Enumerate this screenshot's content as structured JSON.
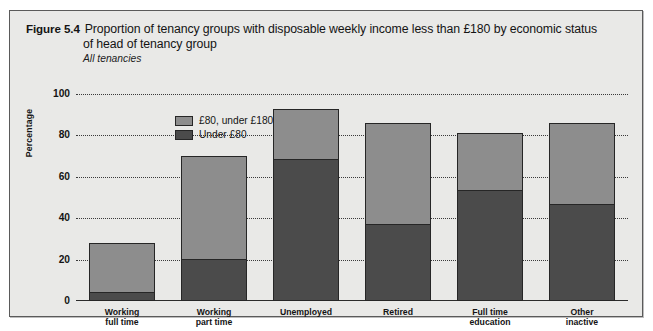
{
  "figure": {
    "number": "Figure 5.4",
    "title_line1": "Proportion of tenancy groups with disposable weekly income less than £180 by economic status",
    "title_line2": "of head of tenancy group",
    "subtitle": "All tenancies"
  },
  "legend": {
    "items": [
      {
        "label": "£80, under £180",
        "color": "#8d8d8d"
      },
      {
        "label": "Under £80",
        "color": "#4b4b4b"
      }
    ]
  },
  "axes": {
    "ylabel": "Percentage",
    "yticks": [
      "100",
      "80",
      "60",
      "40",
      "20",
      "0"
    ]
  },
  "chart_data": {
    "type": "bar",
    "stacked": true,
    "title": "Proportion of tenancy groups with disposable weekly income less than £180 by economic status of head of tenancy group",
    "subtitle": "All tenancies",
    "xlabel": "",
    "ylabel": "Percentage",
    "ylim": [
      0,
      100
    ],
    "ytick_step": 20,
    "grid": "horizontal-dotted",
    "legend_position": "top-left-inside",
    "categories": [
      "Working full time",
      "Working part time",
      "Unemployed",
      "Retired",
      "Full time education",
      "Other inactive"
    ],
    "category_lines": [
      [
        "Working",
        "full time"
      ],
      [
        "Working",
        "part time"
      ],
      [
        "Unemployed",
        ""
      ],
      [
        "Retired",
        ""
      ],
      [
        "Full time",
        "education"
      ],
      [
        "Other",
        "inactive"
      ]
    ],
    "series": [
      {
        "name": "Under £80",
        "color": "#4b4b4b",
        "values": [
          4,
          20,
          69,
          37,
          54,
          47
        ]
      },
      {
        "name": "£80, under £180",
        "color": "#8d8d8d",
        "values": [
          24,
          50,
          24,
          49,
          27,
          39
        ]
      }
    ],
    "totals": [
      28,
      70,
      93,
      86,
      81,
      86
    ]
  }
}
